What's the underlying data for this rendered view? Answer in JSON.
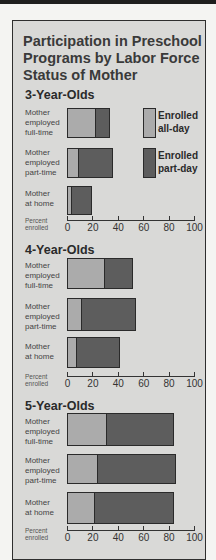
{
  "chart_data": {
    "type": "bar",
    "orientation": "horizontal",
    "stacked": true,
    "title": "Participation in Preschool Programs by Labor Force Status of Mother",
    "xlabel": "Percent enrolled",
    "xlim": [
      0,
      100
    ],
    "xticks": [
      0,
      20,
      40,
      60,
      80,
      100
    ],
    "legend": [
      {
        "name": "Enrolled all-day",
        "color": "#ababab"
      },
      {
        "name": "Enrolled part-day",
        "color": "#5d5d5d"
      }
    ],
    "categories": [
      "Mother employed full-time",
      "Mother employed part-time",
      "Mother at home"
    ],
    "groups": [
      {
        "name": "3-Year-Olds",
        "series": [
          {
            "name": "Enrolled all-day",
            "values": [
              22,
              9,
              3
            ]
          },
          {
            "name": "Enrolled part-day",
            "values": [
              12,
              27,
              17
            ]
          }
        ]
      },
      {
        "name": "4-Year-Olds",
        "series": [
          {
            "name": "Enrolled all-day",
            "values": [
              29,
              11,
              7
            ]
          },
          {
            "name": "Enrolled part-day",
            "values": [
              23,
              43,
              35
            ]
          }
        ]
      },
      {
        "name": "5-Year-Olds",
        "series": [
          {
            "name": "Enrolled all-day",
            "values": [
              31,
              24,
              21
            ]
          },
          {
            "name": "Enrolled part-day",
            "values": [
              53,
              62,
              63
            ]
          }
        ]
      }
    ]
  },
  "title": "Participation in Preschool Programs by Labor Force Status of Mother",
  "legend": {
    "all_day": "Enrolled all-day",
    "all_day_line1": "Enrolled",
    "all_day_line2": "all-day",
    "part_day_line1": "Enrolled",
    "part_day_line2": "part-day"
  },
  "row_labels": [
    [
      "Mother",
      "employed",
      "full-time"
    ],
    [
      "Mother",
      "employed",
      "part-time"
    ],
    [
      "Mother",
      "at home"
    ]
  ],
  "axis": {
    "title_line1": "Percent",
    "title_line2": "enrolled",
    "ticks": [
      "0",
      "20",
      "40",
      "60",
      "80",
      "100"
    ]
  },
  "groups": [
    {
      "heading": "3-Year-Olds"
    },
    {
      "heading": "4-Year-Olds"
    },
    {
      "heading": "5-Year-Olds"
    }
  ],
  "colors": {
    "all_day": "#ababab",
    "part_day": "#5d5d5d",
    "panel": "#d9d9d7"
  }
}
